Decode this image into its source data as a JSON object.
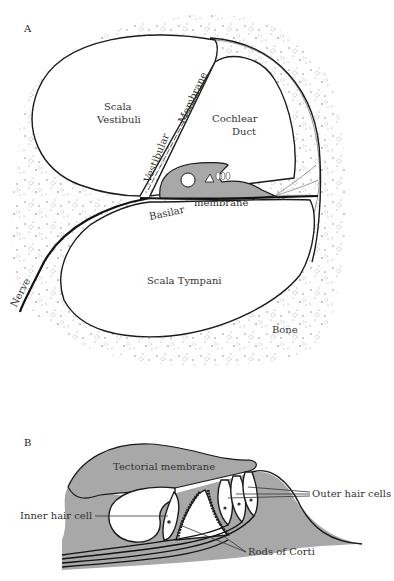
{
  "figure": {
    "panel_a": {
      "label": "A",
      "labels": {
        "scala_vestibuli_1": "Scala",
        "scala_vestibuli_2": "Vestibuli",
        "cochlear_duct_1": "Cochlear",
        "cochlear_duct_2": "Duct",
        "vestibular": "Vestibular",
        "membrane": "Membrane",
        "basilar": "Basilar",
        "basilar_membrane": "membrane",
        "scala_tympani": "Scala Tympani",
        "nerve": "Nerve",
        "bone": "Bone"
      }
    },
    "panel_b": {
      "label": "B",
      "labels": {
        "tectorial_membrane": "Tectorial membrane",
        "outer_hair_cells": "Outer hair cells",
        "inner_hair_cell": "Inner hair cell",
        "rods_of_corti": "Rods of Corti"
      }
    },
    "colors": {
      "tissue_gray": "#a8a8a8",
      "line": "#1a1a1a",
      "background": "#ffffff"
    }
  }
}
